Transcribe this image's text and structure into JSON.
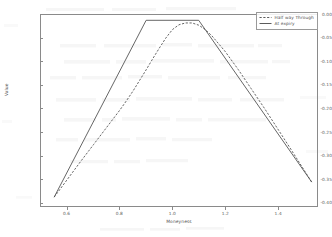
{
  "chart_data": {
    "type": "line",
    "title": "",
    "xlabel": "Moneyness",
    "ylabel": "Value",
    "xlim": [
      0.5,
      1.55
    ],
    "ylim": [
      -0.42,
      0.012
    ],
    "xticks": [
      "0.6",
      "0.8",
      "1.0",
      "1.2",
      "1.4"
    ],
    "xtick_values": [
      0.6,
      0.8,
      1.0,
      1.2,
      1.4
    ],
    "yticks": [
      "0.00",
      "-0.05",
      "-0.10",
      "-0.15",
      "-0.20",
      "-0.25",
      "-0.30",
      "-0.35",
      "-0.40"
    ],
    "ytick_values": [
      0.0,
      -0.05,
      -0.1,
      -0.15,
      -0.2,
      -0.25,
      -0.3,
      -0.35,
      -0.4
    ],
    "grid": false,
    "legend_position": "upper right",
    "series": [
      {
        "name": "Half way Through",
        "style": "dashed",
        "color": "#4a4a4a",
        "x": [
          0.55,
          0.6,
          0.65,
          0.7,
          0.75,
          0.8,
          0.825,
          0.85,
          0.875,
          0.9,
          0.925,
          0.95,
          0.975,
          1.0,
          1.025,
          1.05,
          1.075,
          1.1,
          1.125,
          1.15,
          1.2,
          1.25,
          1.3,
          1.35,
          1.4,
          1.45,
          1.5,
          1.53
        ],
        "y": [
          -0.4,
          -0.36,
          -0.32,
          -0.281,
          -0.242,
          -0.203,
          -0.182,
          -0.16,
          -0.136,
          -0.112,
          -0.087,
          -0.063,
          -0.04,
          -0.021,
          -0.01,
          -0.006,
          -0.006,
          -0.011,
          -0.021,
          -0.035,
          -0.07,
          -0.111,
          -0.155,
          -0.199,
          -0.245,
          -0.291,
          -0.338,
          -0.366
        ]
      },
      {
        "name": "At expiry",
        "style": "solid",
        "color": "#4a4a4a",
        "x": [
          0.55,
          0.9,
          1.1,
          1.53
        ],
        "y": [
          -0.4,
          0.0,
          0.0,
          -0.366
        ]
      }
    ]
  },
  "legend": {
    "entries": [
      {
        "label": "Half way Through",
        "style": "dashed"
      },
      {
        "label": "At expiry",
        "style": "solid"
      }
    ]
  }
}
